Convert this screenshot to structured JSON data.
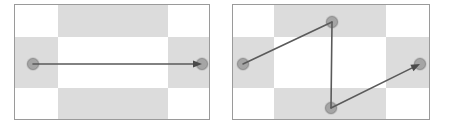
{
  "figure": {
    "width": 449,
    "height": 129,
    "background_color": "#ffffff"
  },
  "style": {
    "panel_border_color": "#9a9a9a",
    "panel_border_width": 1,
    "checker_light_color": "#ffffff",
    "checker_dark_color": "#dcdcdc",
    "stroke_color": "#5a5a5a",
    "stroke_width": 1.6,
    "node_fill_color": "#9b9b9b",
    "node_stroke_color": "#6e6e6e",
    "node_radius": 5.5,
    "arrowhead_color": "#4a4a4a",
    "arrowhead_length": 9,
    "arrowhead_width": 7
  },
  "panels": [
    {
      "id": "left-panel",
      "label": "straight-path-panel",
      "rect": {
        "x": 14,
        "y": 4,
        "width": 196,
        "height": 116
      },
      "checkerboard": {
        "columns": [
          {
            "x": 0,
            "width": 44
          },
          {
            "x": 44,
            "width": 110
          },
          {
            "x": 154,
            "width": 42
          }
        ],
        "rows": [
          {
            "y": 0,
            "height": 33
          },
          {
            "y": 33,
            "height": 51
          },
          {
            "y": 84,
            "height": 32
          }
        ],
        "dark_cells": [
          {
            "col": 1,
            "row": 0
          },
          {
            "col": 0,
            "row": 1
          },
          {
            "col": 2,
            "row": 1
          },
          {
            "col": 1,
            "row": 2
          }
        ]
      },
      "path": {
        "id": "horizontal-arrow",
        "points": [
          {
            "x": 33,
            "y": 64,
            "node": true
          },
          {
            "x": 202,
            "y": 64,
            "node": true,
            "arrowhead": true
          }
        ],
        "segments": 1,
        "direction": "left-to-right"
      }
    },
    {
      "id": "right-panel",
      "label": "zigzag-path-panel",
      "rect": {
        "x": 232,
        "y": 4,
        "width": 198,
        "height": 116
      },
      "checkerboard": {
        "columns": [
          {
            "x": 0,
            "width": 42
          },
          {
            "x": 42,
            "width": 112
          },
          {
            "x": 154,
            "width": 44
          }
        ],
        "rows": [
          {
            "y": 0,
            "height": 33
          },
          {
            "y": 33,
            "height": 51
          },
          {
            "y": 84,
            "height": 32
          }
        ],
        "dark_cells": [
          {
            "col": 1,
            "row": 0
          },
          {
            "col": 0,
            "row": 1
          },
          {
            "col": 2,
            "row": 1
          },
          {
            "col": 1,
            "row": 2
          }
        ]
      },
      "path": {
        "id": "zigzag-arrow",
        "points": [
          {
            "x": 243,
            "y": 64,
            "node": true
          },
          {
            "x": 332,
            "y": 22,
            "node": true
          },
          {
            "x": 331,
            "y": 108,
            "node": true
          },
          {
            "x": 420,
            "y": 64,
            "node": true,
            "arrowhead": true
          }
        ],
        "segments": 3,
        "direction": "left-to-right"
      }
    }
  ]
}
